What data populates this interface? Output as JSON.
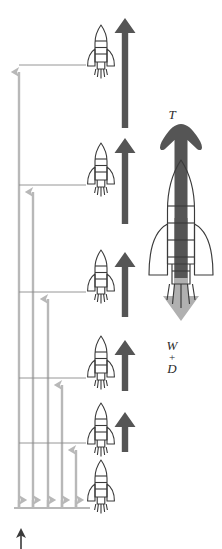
{
  "figure": {
    "type": "diagram",
    "background": "#ffffff",
    "width": 222,
    "height": 549
  },
  "colors": {
    "thrust_arrow_dark": "#555555",
    "measure_arrow_gray": "#b8b8b8",
    "weight_arrow_gray": "#b0b0b0",
    "rocket_outline": "#3a3a3a",
    "leader_line": "#8a8a8a",
    "label_text": "#2b2b2b",
    "baseline": "#b8b8b8"
  },
  "labels": {
    "thrust": "T",
    "weight_drag": {
      "weight": "W",
      "plus": "+",
      "drag": "D"
    }
  },
  "main_rocket": {
    "name": "large-rocket",
    "thrust_label": "T",
    "thrust_direction": "up",
    "weight_drag_label": "W + D",
    "weight_drag_direction": "down",
    "x": 180,
    "y": 250
  },
  "ascent_sequence": {
    "count": 6,
    "rockets": [
      {
        "index": 1,
        "y": 50,
        "thrust_arrow_length": 108,
        "has_thrust_arrow": true,
        "has_leader_line": true,
        "leader_y": 65
      },
      {
        "index": 2,
        "y": 168,
        "thrust_arrow_length": 83,
        "has_thrust_arrow": true,
        "has_leader_line": true,
        "leader_y": 185
      },
      {
        "index": 3,
        "y": 275,
        "thrust_arrow_length": 62,
        "has_thrust_arrow": true,
        "has_leader_line": true,
        "leader_y": 292
      },
      {
        "index": 4,
        "y": 361,
        "thrust_arrow_length": 48,
        "has_thrust_arrow": true,
        "has_leader_line": true,
        "leader_y": 378
      },
      {
        "index": 5,
        "y": 429,
        "thrust_arrow_length": 36,
        "has_thrust_arrow": true,
        "has_leader_line": true,
        "leader_y": 443
      },
      {
        "index": 6,
        "y": 486,
        "thrust_arrow_length": 0,
        "has_thrust_arrow": false,
        "has_leader_line": false,
        "leader_y": 508
      }
    ]
  },
  "measure_arrows": {
    "description": "vertical gray arrows indicating altitude reached at each stage",
    "baseline_y": 508,
    "arrows": [
      {
        "index": 1,
        "x": 19,
        "top_y": 65,
        "height": 443
      },
      {
        "index": 2,
        "x": 33,
        "top_y": 185,
        "height": 323
      },
      {
        "index": 3,
        "x": 48,
        "top_y": 292,
        "height": 216
      },
      {
        "index": 4,
        "x": 62,
        "top_y": 378,
        "height": 130
      },
      {
        "index": 5,
        "x": 76,
        "top_y": 443,
        "height": 65
      }
    ]
  },
  "ground_arrow": {
    "name": "ground-up-arrow",
    "x": 21,
    "y": 528,
    "direction": "up",
    "color": "#3a3a3a"
  }
}
